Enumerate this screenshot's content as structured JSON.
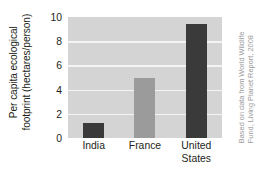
{
  "chart_data": {
    "type": "bar",
    "title": "",
    "subtitle": "",
    "categories": [
      "India",
      "France",
      "United States"
    ],
    "category_lines": [
      [
        "India"
      ],
      [
        "France"
      ],
      [
        "United",
        "States"
      ]
    ],
    "values": [
      1.2,
      5.0,
      9.4
    ],
    "series": [
      {
        "name": "Per capita ecological footprint",
        "values": [
          1.2,
          5.0,
          9.4
        ]
      }
    ],
    "xlabel": "",
    "ylabel_lines": [
      "Per capita ecological",
      "footprint (hectares/person)"
    ],
    "ylabel": "Per capita ecological footprint (hectares/person)",
    "ylim": [
      0,
      10
    ],
    "ytick_values": [
      0,
      2,
      4,
      6,
      8,
      10
    ],
    "ytick_labels": [
      "0",
      "2",
      "4",
      "6",
      "8",
      "10"
    ],
    "grid": true,
    "grid_orientation": "horizontal",
    "legend": false,
    "legend_position": "none",
    "bar_colors": [
      "#3a3a3a",
      "#9b9b9b",
      "#3a3a3a"
    ],
    "plot_background": "#d4d4d4",
    "gridline_color": "#f4f4f4",
    "figure_background": "#ffffff",
    "annotations": [
      {
        "name": "source-credit",
        "text": "Based on data from World Wildlife Fund, Living Planet Report, 2008",
        "lines": [
          "Based on data from World Wildlife",
          "Fund, Living Planet Report, 2008"
        ],
        "position": "right-margin",
        "rotation": -90,
        "color": "#9a9a9a"
      }
    ]
  }
}
